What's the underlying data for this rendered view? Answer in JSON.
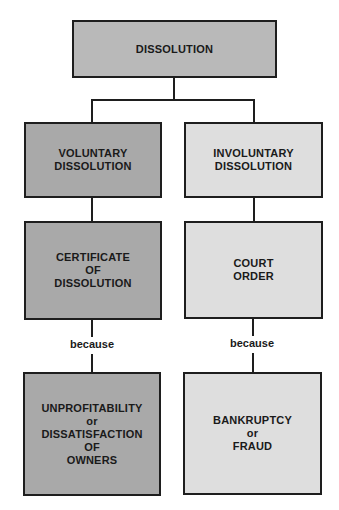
{
  "diagram": {
    "root": {
      "lines": [
        "DISSOLUTION"
      ]
    },
    "left_branch": {
      "level1": {
        "lines": [
          "VOLUNTARY",
          "DISSOLUTION"
        ]
      },
      "level2": {
        "lines": [
          "CERTIFICATE",
          "OF",
          "DISSOLUTION"
        ]
      },
      "connector_label": "because",
      "level3": {
        "lines": [
          "UNPROFITABILITY",
          "or",
          "DISSATISFACTION",
          "OF",
          "OWNERS"
        ]
      }
    },
    "right_branch": {
      "level1": {
        "lines": [
          "INVOLUNTARY",
          "DISSOLUTION"
        ]
      },
      "level2": {
        "lines": [
          "COURT",
          "ORDER"
        ]
      },
      "connector_label": "because",
      "level3": {
        "lines": [
          "BANKRUPTCY",
          "or",
          "FRAUD"
        ]
      }
    },
    "colors": {
      "root_fill": "#b9b9b9",
      "voluntary_fill": "#a9a9a9",
      "involuntary_fill": "#dedede",
      "stroke": "#1e1e1e"
    }
  }
}
